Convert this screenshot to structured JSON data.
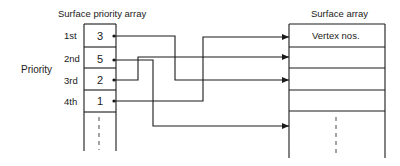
{
  "left_array": {
    "title": "Surface priority array",
    "axis_label": "Priority",
    "rows": [
      {
        "rank": "1st",
        "value": "3"
      },
      {
        "rank": "2nd",
        "value": "5"
      },
      {
        "rank": "3rd",
        "value": "2"
      },
      {
        "rank": "4th",
        "value": "1"
      }
    ]
  },
  "right_array": {
    "title": "Surface array",
    "first_cell": "Vertex nos."
  },
  "connections": [
    {
      "from_rank": "1st",
      "value": "3",
      "to_row": 3
    },
    {
      "from_rank": "2nd",
      "value": "5",
      "to_row": 5
    },
    {
      "from_rank": "3rd",
      "value": "2",
      "to_row": 2
    },
    {
      "from_rank": "4th",
      "value": "1",
      "to_row": 1
    }
  ],
  "colors": {
    "line": "#1a1a1a",
    "background": "#ffffff"
  }
}
